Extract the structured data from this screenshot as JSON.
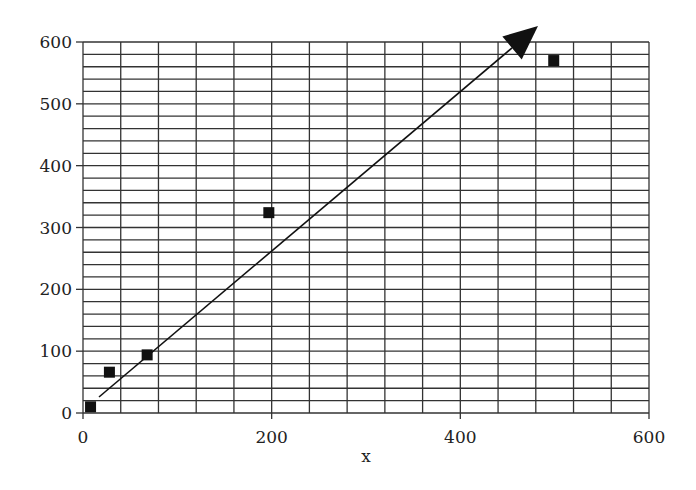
{
  "chart_data": {
    "type": "scatter",
    "title": "",
    "xlabel": "x",
    "ylabel": "",
    "xlim": [
      0,
      600
    ],
    "ylim": [
      0,
      600
    ],
    "x_ticks": [
      0,
      200,
      400,
      600
    ],
    "y_ticks": [
      0,
      100,
      200,
      300,
      400,
      500,
      600
    ],
    "x_minor_step": 40,
    "y_minor_step": 20,
    "grid": true,
    "legend": null,
    "series": [
      {
        "name": "data",
        "marker": "square",
        "color": "#111111",
        "x": [
          8,
          28,
          68,
          197,
          499
        ],
        "y": [
          10,
          66,
          94,
          324,
          570
        ]
      }
    ],
    "annotations": [
      {
        "type": "arrow",
        "from": [
          17,
          26
        ],
        "to": [
          480,
          626
        ],
        "color": "#111111",
        "description": "trend line arrow"
      }
    ]
  }
}
